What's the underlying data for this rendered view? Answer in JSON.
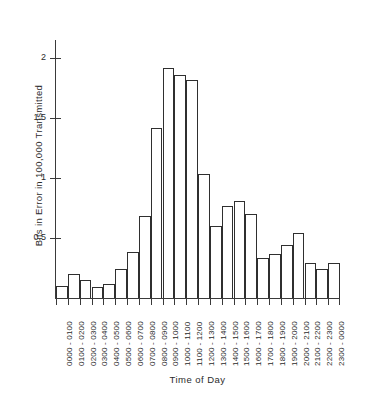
{
  "chart_data": {
    "type": "bar",
    "title": "",
    "xlabel": "Time of Day",
    "ylabel": "Bits in Error in 100,000 Transmitted",
    "categories": [
      "0000 - 0100",
      "0100 - 0200",
      "0200 - 0300",
      "0300 - 0400",
      "0400 - 0500",
      "0500 - 0600",
      "0600 - 0700",
      "0700 - 0800",
      "0800 - 0900",
      "0900 - 1000",
      "1000 - 1100",
      "1100 - 1200",
      "1200 - 1300",
      "1300 - 1400",
      "1400 - 1500",
      "1500 - 1600",
      "1600 - 1700",
      "1700 - 1800",
      "1800 - 1900",
      "1900 - 2000",
      "2000 - 2100",
      "2100 - 2200",
      "2200 - 2300",
      "2300 - 0000"
    ],
    "values": [
      0.1,
      0.2,
      0.15,
      0.09,
      0.12,
      0.24,
      0.38,
      0.68,
      1.42,
      1.92,
      1.86,
      1.82,
      1.03,
      0.6,
      0.77,
      0.81,
      0.7,
      0.33,
      0.37,
      0.44,
      0.54,
      0.29,
      0.24,
      0.29
    ],
    "ylim": [
      0,
      2.15
    ],
    "yticks": [
      0.5,
      1,
      1.5,
      2
    ],
    "ytick_labels": [
      "0.5",
      "1",
      "1.5",
      "2"
    ],
    "grid": false,
    "legend": false,
    "bar_fill_color": "#ffffff",
    "bar_edge_color": "#2f2f2f",
    "axis_color": "#3a3a3a"
  }
}
